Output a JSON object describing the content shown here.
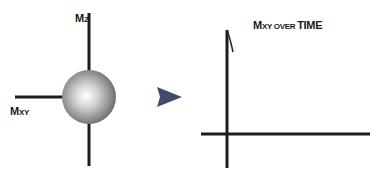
{
  "left_panel": {
    "vertical_axis_label": {
      "main": "M",
      "sub": "Z"
    },
    "horizontal_axis_label": {
      "main": "M",
      "sub": "XY"
    },
    "sphere": {
      "name": "magnetization-sphere",
      "highlight_color": "#ffffff",
      "base_color": "#8a8a8a",
      "edge_color": "#5e5e5e"
    },
    "arrow": {
      "direction": "right",
      "color": "#4a5275"
    }
  },
  "right_panel": {
    "title": {
      "part1_main": "M",
      "part1_sub": "XY OVER ",
      "part2": "TIME"
    },
    "curve": {
      "description": "short decay segment starting at top of vertical axis"
    }
  },
  "colors": {
    "axis": "#1c1c1c",
    "arrow": "#4a5275",
    "text": "#1a1a1a"
  }
}
